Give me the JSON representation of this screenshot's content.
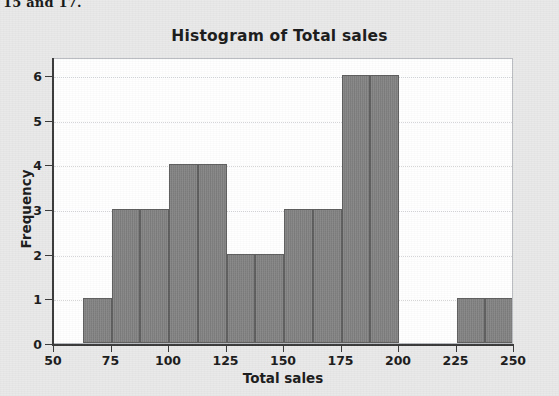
{
  "page": {
    "cut_off_text": "15 and 17.",
    "background_color": "#e9e9e9"
  },
  "figure": {
    "plot_background_color": "#ffffff",
    "frame_color": "#b9bcc0",
    "axis_color": "#3a3a3a",
    "bar_fill_color": "#828282",
    "bar_edge_color": "#5e5e5e",
    "gridline_color": "#d2d6da"
  },
  "chart_data": {
    "type": "bar",
    "title": "Histogram of Total sales",
    "xlabel": "Total sales",
    "ylabel": "Frequency",
    "xlim": [
      50,
      250
    ],
    "ylim": [
      0,
      6.4
    ],
    "grid": true,
    "legend": null,
    "xticks": [
      50,
      75,
      100,
      125,
      150,
      175,
      200,
      225,
      250
    ],
    "xtick_labels": [
      "50",
      "75",
      "100",
      "125",
      "150",
      "175",
      "200",
      "225",
      "250"
    ],
    "yticks": [
      0,
      1,
      2,
      3,
      4,
      5,
      6
    ],
    "ytick_labels": [
      "0",
      "1",
      "2",
      "3",
      "4",
      "5",
      "6"
    ],
    "bin_width": 12.5,
    "bins": [
      {
        "start": 62.5,
        "end": 75.0,
        "frequency": 1
      },
      {
        "start": 75.0,
        "end": 87.5,
        "frequency": 3
      },
      {
        "start": 87.5,
        "end": 100.0,
        "frequency": 3
      },
      {
        "start": 100.0,
        "end": 112.5,
        "frequency": 4
      },
      {
        "start": 112.5,
        "end": 125.0,
        "frequency": 4
      },
      {
        "start": 125.0,
        "end": 137.5,
        "frequency": 2
      },
      {
        "start": 137.5,
        "end": 150.0,
        "frequency": 2
      },
      {
        "start": 150.0,
        "end": 162.5,
        "frequency": 3
      },
      {
        "start": 162.5,
        "end": 175.0,
        "frequency": 3
      },
      {
        "start": 175.0,
        "end": 187.5,
        "frequency": 6
      },
      {
        "start": 187.5,
        "end": 200.0,
        "frequency": 6
      },
      {
        "start": 225.0,
        "end": 237.5,
        "frequency": 1
      },
      {
        "start": 237.5,
        "end": 250.0,
        "frequency": 1
      }
    ]
  }
}
